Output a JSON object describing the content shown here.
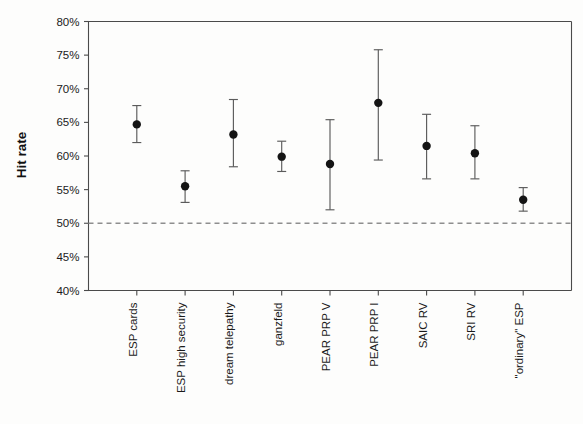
{
  "chart_data": {
    "type": "scatter",
    "title": "",
    "subtitle": "",
    "xlabel": "",
    "ylabel": "Hit rate",
    "ylim": [
      40,
      80
    ],
    "ytick_values": [
      40,
      45,
      50,
      55,
      60,
      65,
      70,
      75,
      80
    ],
    "ytick_labels": [
      "40%",
      "45%",
      "50%",
      "55%",
      "60%",
      "65%",
      "70%",
      "75%",
      "80%"
    ],
    "grid": false,
    "legend": null,
    "legend_position": "none",
    "reference_line": {
      "value": 50,
      "label": "50%",
      "style": "dashed",
      "color": "#8e8e8e"
    },
    "marker": "filled-circle",
    "error_bars": "vertical",
    "categories": [
      "ESP cards",
      "ESP high security",
      "dream telepathy",
      "ganzfeld",
      "PEAR PRP V",
      "PEAR PRP I",
      "SAIC RV",
      "SRI RV",
      "\"ordinary\" ESP"
    ],
    "values": [
      64.7,
      55.5,
      63.2,
      59.9,
      58.8,
      67.9,
      61.5,
      60.4,
      53.5
    ],
    "error_low": [
      62.0,
      53.1,
      58.4,
      57.7,
      52.0,
      59.4,
      56.6,
      56.6,
      51.8
    ],
    "error_high": [
      67.5,
      57.8,
      68.4,
      62.2,
      65.4,
      75.8,
      66.2,
      64.5,
      55.3
    ],
    "series": [
      {
        "name": "Hit rate",
        "points": [
          {
            "category": "ESP cards",
            "value": 64.7,
            "low": 62.0,
            "high": 67.5
          },
          {
            "category": "ESP high security",
            "value": 55.5,
            "low": 53.1,
            "high": 57.8
          },
          {
            "category": "dream telepathy",
            "value": 63.2,
            "low": 58.4,
            "high": 68.4
          },
          {
            "category": "ganzfeld",
            "value": 59.9,
            "low": 57.7,
            "high": 62.2
          },
          {
            "category": "PEAR PRP V",
            "value": 58.8,
            "low": 52.0,
            "high": 65.4
          },
          {
            "category": "PEAR PRP I",
            "value": 67.9,
            "low": 59.4,
            "high": 75.8
          },
          {
            "category": "SAIC RV",
            "value": 61.5,
            "low": 56.6,
            "high": 66.2
          },
          {
            "category": "SRI RV",
            "value": 60.4,
            "low": 56.6,
            "high": 64.5
          },
          {
            "category": "\"ordinary\" ESP",
            "value": 53.5,
            "low": 51.8,
            "high": 55.3
          }
        ]
      }
    ],
    "colors": {
      "marker": "#141414",
      "error_bar": "#5b5b5b",
      "axis": "#4a4a4a",
      "reference_line": "#8e8e8e",
      "background": "#fdfdfc",
      "text": "#1a1a1a"
    }
  }
}
